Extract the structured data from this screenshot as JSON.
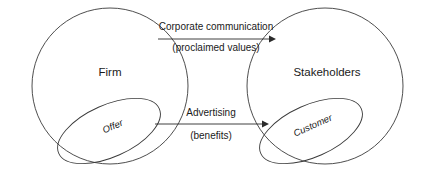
{
  "diagram": {
    "title": "",
    "colors": {
      "background": "#ffffff",
      "outline": "#3a3a3a",
      "connector": "#2b2b2b",
      "text": "#1a1a1a"
    },
    "nodes": [
      {
        "id": "firm",
        "label": "Firm",
        "shape": "circle",
        "cx": 110,
        "cy": 86,
        "r": 78
      },
      {
        "id": "stakeholders",
        "label": "Stakeholders",
        "shape": "circle",
        "cx": 325,
        "cy": 86,
        "r": 78
      }
    ],
    "sub_nodes": [
      {
        "id": "offer",
        "label": "Offer",
        "shape": "ellipse",
        "cx": 109,
        "cy": 131,
        "rx": 55,
        "ry": 26,
        "rotation": -24
      },
      {
        "id": "customer",
        "label": "Customer",
        "shape": "ellipse",
        "cx": 311,
        "cy": 131,
        "rx": 55,
        "ry": 26,
        "rotation": -24
      }
    ],
    "edges": [
      {
        "id": "corporate-communication",
        "label_line1": "Corporate communication",
        "label_line2": "(proclaimed values)",
        "from": "firm",
        "to": "stakeholders",
        "direction": "right",
        "x1": 158,
        "x2": 274,
        "y": 39
      },
      {
        "id": "advertising",
        "label_line1": "Advertising",
        "label_line2": "(benefits)",
        "from": "offer",
        "to": "customer",
        "direction": "right",
        "x1": 155,
        "x2": 267,
        "y": 124
      }
    ]
  }
}
